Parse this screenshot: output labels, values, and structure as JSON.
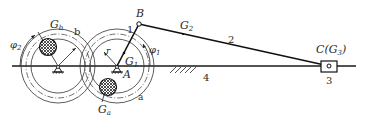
{
  "diagram": {
    "type": "mechanism",
    "labels": {
      "B": "B",
      "G2": "G",
      "G2_sub": "2",
      "link2": "2",
      "C": "C(G",
      "C_sub": "3",
      "C_close": ")",
      "slider3": "3",
      "ground4": "4",
      "A": "A",
      "G1": "G",
      "G1_sub": "1",
      "crank1": "1",
      "r": "r",
      "phi1": "φ",
      "phi1_sub": "1",
      "phi2": "φ",
      "phi2_sub": "2",
      "Gb": "G",
      "Gb_sub": "b",
      "b": "b",
      "Ga": "G",
      "Ga_sub": "a",
      "a": "a"
    },
    "colors": {
      "line": "#1a1a1a",
      "text": "#2a2a2a"
    }
  }
}
